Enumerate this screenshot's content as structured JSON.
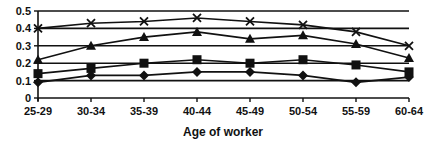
{
  "chart_data": {
    "type": "line",
    "title": "",
    "xlabel": "Age of worker",
    "ylabel": "",
    "ylim": [
      0,
      0.5
    ],
    "yticks": [
      "0",
      "0.1",
      "0.2",
      "0.3",
      "0.4",
      "0.5"
    ],
    "grid": "horizontal",
    "legend": "none",
    "categories": [
      "25-29",
      "30-34",
      "35-39",
      "40-44",
      "45-49",
      "50-54",
      "55-59",
      "60-64"
    ],
    "series": [
      {
        "name": "cross",
        "marker": "x",
        "values": [
          0.4,
          0.43,
          0.44,
          0.46,
          0.44,
          0.42,
          0.38,
          0.3
        ]
      },
      {
        "name": "triangle",
        "marker": "triangle",
        "values": [
          0.22,
          0.3,
          0.35,
          0.38,
          0.34,
          0.36,
          0.31,
          0.23
        ]
      },
      {
        "name": "square",
        "marker": "square",
        "values": [
          0.14,
          0.17,
          0.2,
          0.22,
          0.2,
          0.22,
          0.19,
          0.15
        ]
      },
      {
        "name": "diamond",
        "marker": "diamond",
        "values": [
          0.09,
          0.13,
          0.13,
          0.15,
          0.15,
          0.13,
          0.09,
          0.12
        ]
      }
    ],
    "colors": {
      "line": "#111111",
      "grid": "#111111",
      "background": "#ffffff"
    }
  }
}
